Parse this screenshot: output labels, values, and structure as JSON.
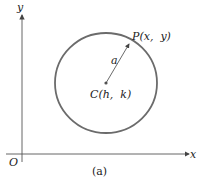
{
  "figure": {
    "caption": "(a)",
    "axes": {
      "x_label": "x",
      "y_label": "y",
      "origin_label": "O"
    },
    "circle": {
      "center_label": "C(h,  k)",
      "point_label": "P(x,  y)",
      "radius_label": "a",
      "stroke_color": "#6b6b6b"
    }
  }
}
